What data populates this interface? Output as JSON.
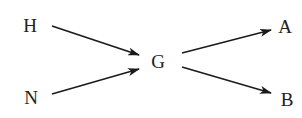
{
  "diagram": {
    "type": "directed-graph",
    "nodes": [
      {
        "id": "H",
        "label": "H",
        "x": 30,
        "y": 25
      },
      {
        "id": "N",
        "label": "N",
        "x": 31,
        "y": 97
      },
      {
        "id": "G",
        "label": "G",
        "x": 157,
        "y": 61
      },
      {
        "id": "A",
        "label": "A",
        "x": 285,
        "y": 26
      },
      {
        "id": "B",
        "label": "B",
        "x": 287,
        "y": 99
      }
    ],
    "edges": [
      {
        "from": "H",
        "to": "G"
      },
      {
        "from": "N",
        "to": "G"
      },
      {
        "from": "G",
        "to": "A"
      },
      {
        "from": "G",
        "to": "B"
      }
    ],
    "colors": {
      "stroke": "#1a1a1a",
      "text": "#222222",
      "background": "#ffffff"
    }
  }
}
